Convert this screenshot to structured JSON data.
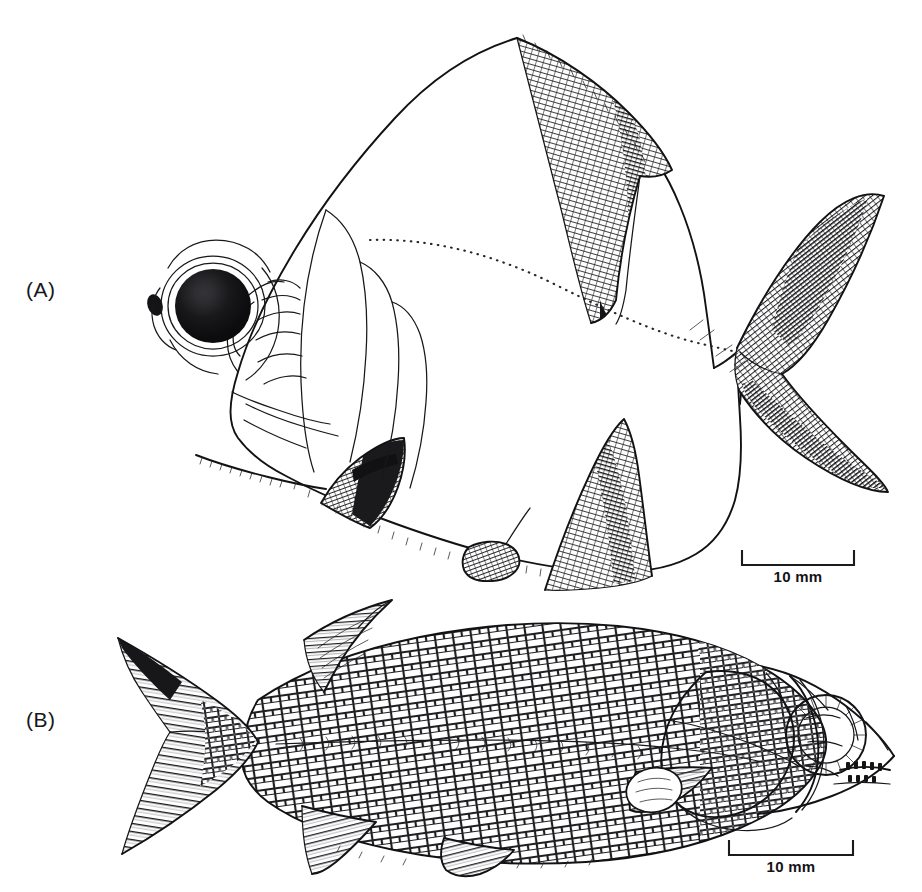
{
  "figure": {
    "background_color": "#ffffff",
    "ink_color": "#121214",
    "width": 922,
    "height": 892,
    "type": "scientific-line-illustration"
  },
  "panels": [
    {
      "id": "A",
      "label": "(A)",
      "subject_name": "deep-bodied-fish-lateral-view",
      "orientation": "facing-left",
      "features": [
        "dorsal-fin",
        "caudal-fin",
        "anal-fin",
        "pectoral-fin",
        "pelvic-fin",
        "eye",
        "lateral-line-dotted",
        "head-plates",
        "serrated-ventral-margin"
      ],
      "scalebar": {
        "label": "10 mm",
        "length_mm": 10
      }
    },
    {
      "id": "B",
      "label": "(B)",
      "subject_name": "elongate-scaled-fish-lateral-view",
      "orientation": "facing-right",
      "features": [
        "dorsal-fin",
        "caudal-fin-forked",
        "anal-fin",
        "pelvic-fin",
        "pectoral-fin",
        "eye-with-sclerotic-ring",
        "operculum-plates",
        "body-scales",
        "lateral-line",
        "jaw-teeth"
      ],
      "scalebar": {
        "label": "10 mm",
        "length_mm": 10
      }
    }
  ],
  "scalebars": {
    "panel_a": {
      "label": "10 mm"
    },
    "panel_b": {
      "label": "10 mm"
    }
  }
}
